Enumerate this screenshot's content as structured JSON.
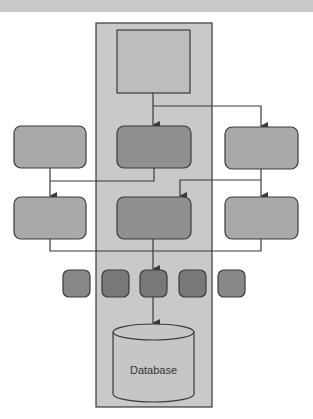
{
  "colors": {
    "top_band": "#c9c9c9",
    "column_fill": "#c9c9c9",
    "stroke": "#3a3a3a",
    "top_box_fill": "#bdbdbd",
    "side_box_fill": "#a9a9a9",
    "center_box_fill": "#8f8f8f",
    "small_square_fill": "#787878",
    "small_square_outer_fill": "#888888",
    "cylinder_fill": "#c6c6c6"
  },
  "diagram": {
    "database": {
      "label": "Database"
    },
    "nodes": [
      {
        "id": "top-box",
        "x": 117,
        "y": 30,
        "w": 73,
        "h": 63
      },
      {
        "id": "left-box-1",
        "x": 14,
        "y": 126,
        "w": 72,
        "h": 42
      },
      {
        "id": "center-box-1",
        "x": 117,
        "y": 126,
        "w": 74,
        "h": 42
      },
      {
        "id": "right-box-1",
        "x": 225,
        "y": 127,
        "w": 73,
        "h": 42
      },
      {
        "id": "left-box-2",
        "x": 14,
        "y": 197,
        "w": 72,
        "h": 42
      },
      {
        "id": "center-box-2",
        "x": 117,
        "y": 197,
        "w": 74,
        "h": 42
      },
      {
        "id": "right-box-2",
        "x": 225,
        "y": 197,
        "w": 73,
        "h": 42
      }
    ],
    "small_squares": [
      {
        "x": 63,
        "outer": true
      },
      {
        "x": 102,
        "outer": false
      },
      {
        "x": 140,
        "outer": false
      },
      {
        "x": 179,
        "outer": false
      },
      {
        "x": 218,
        "outer": true
      }
    ]
  }
}
